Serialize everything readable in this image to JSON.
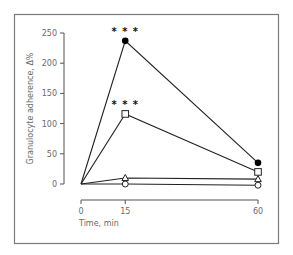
{
  "chart_data": {
    "type": "line",
    "title": "",
    "xlabel": "Time, min",
    "ylabel": "Granulocyte adherence, Δ%",
    "x": [
      0,
      15,
      60
    ],
    "xticks": [
      0,
      15,
      60
    ],
    "yticks": [
      0,
      50,
      100,
      150,
      200,
      250
    ],
    "xlim": [
      0,
      60
    ],
    "ylim": [
      0,
      250
    ],
    "grid": false,
    "legend": null,
    "series": [
      {
        "name": "filled-circle",
        "marker": "circle-filled",
        "values": [
          0,
          237,
          35
        ]
      },
      {
        "name": "open-square",
        "marker": "square-open",
        "values": [
          0,
          116,
          20
        ]
      },
      {
        "name": "open-triangle",
        "marker": "triangle-open",
        "values": [
          0,
          10,
          8
        ]
      },
      {
        "name": "open-circle",
        "marker": "circle-open",
        "values": [
          0,
          0,
          -2
        ]
      }
    ],
    "annotations": [
      {
        "text": "* * *",
        "x": 15,
        "series": "filled-circle"
      },
      {
        "text": "* * *",
        "x": 15,
        "series": "open-square"
      }
    ]
  },
  "colors": {
    "line": "#222222",
    "axis": "#555555",
    "frame": "#7a7a7a",
    "text": "#6a6a6a"
  }
}
